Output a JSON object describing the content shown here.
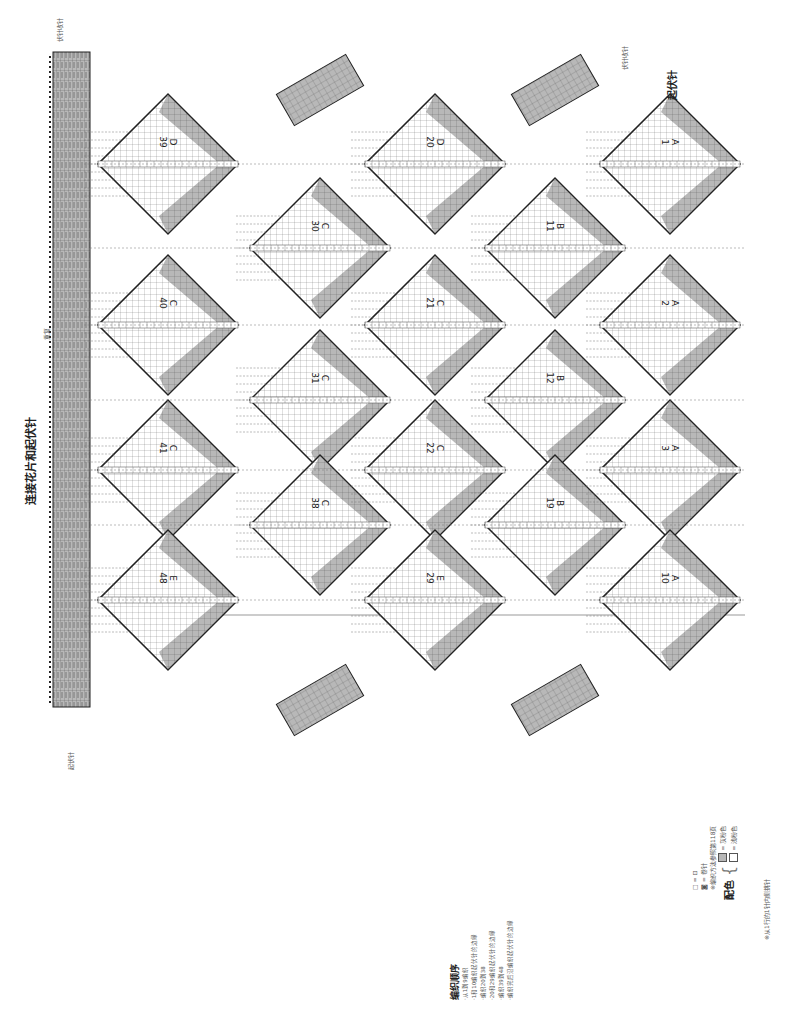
{
  "title": "连接花片和起伏针",
  "repeat_label": "重复",
  "cast_on_label_left": "起伏针",
  "bind_off_label_top": "伏针收针",
  "bind_off_label_right": "伏针收针",
  "garter_label_right": "起伏针",
  "row_markers": [
    "⑧",
    "⑥",
    "①"
  ],
  "instructions": {
    "title": "编织顺序",
    "lines": [
      "·从1到9编织",
      "·1和10编织起伏针的边缘",
      "·编织20到38",
      "·20和29编织起伏针的边缘",
      "·编织39到48",
      "·编织完后沿编织起伏针的边缘"
    ]
  },
  "legend": {
    "symbol1": "□ = ⊡",
    "symbol2": "◙ = 卷针",
    "note1": "※编织方法参照第118页",
    "color_title": "配色",
    "color_dark_label": "= 灰粉色",
    "color_light_label": "= 浅粉色",
    "note2": "※从1行的1针内侧挑针",
    "dark_color": "#b8b8b8",
    "light_color": "#ffffff"
  },
  "motifs": [
    {
      "letter": "D",
      "num": "39",
      "cx": 168,
      "cy": 164
    },
    {
      "letter": "C",
      "num": "40",
      "cx": 168,
      "cy": 325
    },
    {
      "letter": "C",
      "num": "41",
      "cx": 168,
      "cy": 470
    },
    {
      "letter": "E",
      "num": "48",
      "cx": 168,
      "cy": 600
    },
    {
      "letter": "C",
      "num": "30",
      "cx": 320,
      "cy": 248
    },
    {
      "letter": "C",
      "num": "31",
      "cx": 320,
      "cy": 400
    },
    {
      "letter": "C",
      "num": "38",
      "cx": 320,
      "cy": 525
    },
    {
      "letter": "D",
      "num": "20",
      "cx": 435,
      "cy": 164
    },
    {
      "letter": "C",
      "num": "21",
      "cx": 435,
      "cy": 325
    },
    {
      "letter": "C",
      "num": "22",
      "cx": 435,
      "cy": 470
    },
    {
      "letter": "E",
      "num": "29",
      "cx": 435,
      "cy": 600
    },
    {
      "letter": "B",
      "num": "11",
      "cx": 555,
      "cy": 248
    },
    {
      "letter": "B",
      "num": "12",
      "cx": 555,
      "cy": 400
    },
    {
      "letter": "B",
      "num": "19",
      "cx": 555,
      "cy": 525
    },
    {
      "letter": "A",
      "num": "1",
      "cx": 670,
      "cy": 164
    },
    {
      "letter": "A",
      "num": "2",
      "cx": 670,
      "cy": 325
    },
    {
      "letter": "A",
      "num": "3",
      "cx": 670,
      "cy": 470
    },
    {
      "letter": "A",
      "num": "10",
      "cx": 670,
      "cy": 600
    }
  ]
}
